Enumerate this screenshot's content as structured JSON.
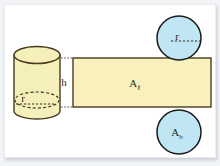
{
  "figure": {
    "colors": {
      "cylinder_fill": "#F5EFB9",
      "rect_fill": "#F8F1BE",
      "circle_fill": "#BFE6F2",
      "outline": "#4A3B20",
      "circle_outline": "#1A1A1A",
      "label_text": "#2B2B28",
      "frame_background": "#F2F4F6",
      "canvas_background": "#FFFFFF",
      "guide_line": "#55524A"
    },
    "labels": {
      "cylinder_height": "h",
      "cylinder_radius": "r",
      "top_circle_radius": "r",
      "lateral_area": "A",
      "lateral_area_subscript": "ℓ",
      "base_area": "A",
      "base_area_subscript": "b"
    },
    "shapes": {
      "cylinder": {
        "name": "cylinder",
        "center_x": 35,
        "top_ellipse_cy": 54,
        "bottom_ellipse_cy": 110,
        "rx": 23,
        "ry": 8
      },
      "rectangle": {
        "name": "lateral-surface-rectangle",
        "x": 70,
        "y": 57,
        "width": 140,
        "height": 49
      },
      "top_circle": {
        "name": "top-base-circle",
        "cx": 176,
        "cy": 36,
        "r": 22
      },
      "bottom_circle": {
        "name": "bottom-base-circle",
        "cx": 176,
        "cy": 130,
        "r": 22
      }
    }
  }
}
